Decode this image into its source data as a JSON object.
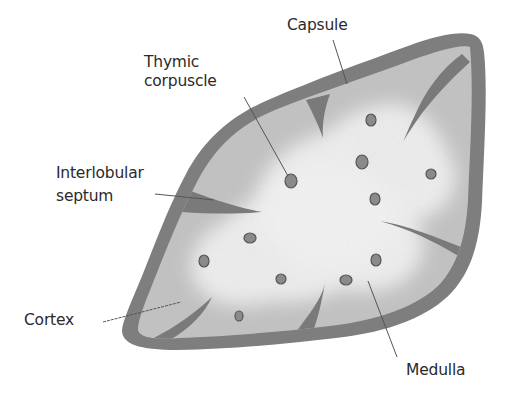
{
  "diagram": {
    "labels": {
      "capsule": "Capsule",
      "thymic_corpuscle_line1": "Thymic",
      "thymic_corpuscle_line2": "corpuscle",
      "interlobular_septum_line1": "Interlobular",
      "interlobular_septum_line2": "septum",
      "cortex": "Cortex",
      "medulla": "Medulla"
    },
    "colors": {
      "background": "#ffffff",
      "capsule": "#7e7e7e",
      "septum": "#7a7a7a",
      "cortex": "#c2c2c2",
      "medulla": "#ededed",
      "corpuscle_fill": "#8a8a8a",
      "corpuscle_stroke": "#555555",
      "text": "#2a2a2a",
      "leader_line": "#555555"
    },
    "corpuscle_count": 11
  }
}
